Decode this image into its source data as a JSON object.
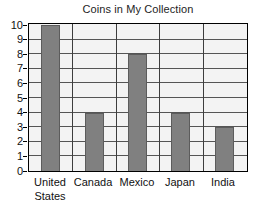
{
  "chart_data": {
    "type": "bar",
    "title": "Coins in My Collection",
    "xlabel": "",
    "ylabel": "",
    "categories": [
      "United States",
      "Canada",
      "Mexico",
      "Japan",
      "India"
    ],
    "values": [
      10,
      4,
      8,
      4,
      3
    ],
    "ylim": [
      0,
      10
    ],
    "y_ticks": [
      "0",
      "1",
      "2",
      "3",
      "4",
      "5",
      "6",
      "7",
      "8",
      "9",
      "10"
    ],
    "grid": true,
    "legend": "none",
    "colors": {
      "bar_fill": "#808080",
      "bar_edge": "#5c5c5c",
      "plot_background": "#f3f3f3",
      "frame": "#000000",
      "gridline": "#555555",
      "text": "#111111"
    }
  }
}
